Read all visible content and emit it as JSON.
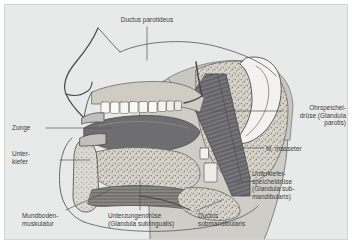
{
  "figure": {
    "kind": "anatomical-illustration",
    "language": "de",
    "plate_color": "#e8e9e9",
    "ink_color": "#3a3a3a"
  },
  "labels": {
    "ductus_parotideus": "Ductus parotideus",
    "parotis": "Ohrspeichel-\ndrüse (Glandula\nparotis)",
    "masseter": "M. masseter",
    "submandibular_gland": "Unterkiefer-\nspeicheldrüse\n(Glandula sub-\nmandibularis)",
    "ductus_submandibularis": "Ductus\nsubmandibularis",
    "zunge": "Zunge",
    "unterkiefer": "Unter-\nkiefer",
    "mundbodenmuskulatur": "Mundboden-\nmuskulatur",
    "sublingual_gland": "Unterzungendrüse\n(Glandula sublingualis)"
  },
  "structures": [
    {
      "id": "nose",
      "label": "nose profile"
    },
    {
      "id": "upper-teeth",
      "label": "upper dental arch"
    },
    {
      "id": "lower-teeth",
      "label": "lower dental arch"
    },
    {
      "id": "tongue",
      "label": "Zunge"
    },
    {
      "id": "hard-palate",
      "label": "hard palate"
    },
    {
      "id": "parotid-gland",
      "label": "Glandula parotis"
    },
    {
      "id": "parotid-duct",
      "label": "Ductus parotideus"
    },
    {
      "id": "masseter-muscle",
      "label": "M. masseter"
    },
    {
      "id": "mandible",
      "label": "Unterkiefer"
    },
    {
      "id": "sublingual-gland",
      "label": "Glandula sublingualis"
    },
    {
      "id": "submandibular-gland",
      "label": "Glandula submandibularis"
    },
    {
      "id": "submandibular-duct",
      "label": "Ductus submandibularis"
    },
    {
      "id": "mouth-floor-muscle",
      "label": "Mundbodenmuskulatur"
    },
    {
      "id": "ear",
      "label": "auricle"
    }
  ]
}
